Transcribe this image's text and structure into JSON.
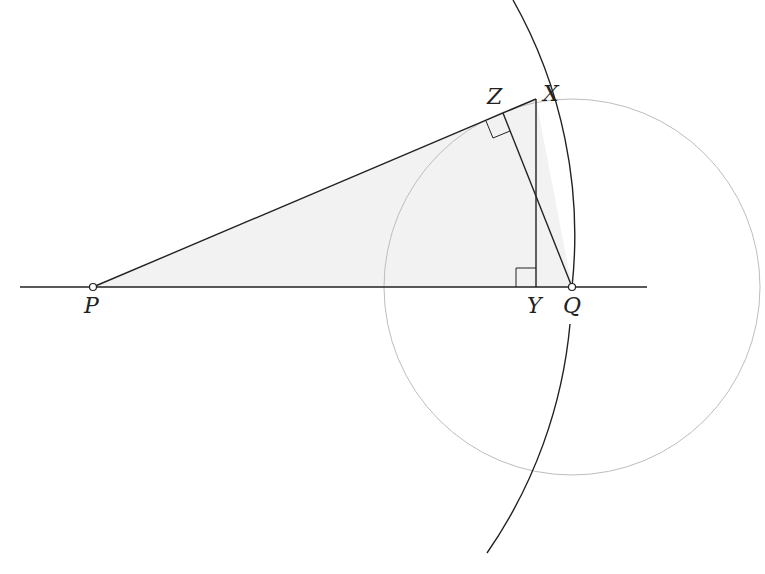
{
  "diagram": {
    "points": {
      "P": {
        "label": "P",
        "x": 93,
        "y": 287
      },
      "Q": {
        "label": "Q",
        "x": 572,
        "y": 287
      },
      "X": {
        "label": "X",
        "x": 536,
        "y": 99
      },
      "Y": {
        "label": "Y",
        "x": 536,
        "y": 287
      },
      "Z": {
        "label": "Z",
        "x": 503,
        "y": 113
      }
    },
    "labels": {
      "P": "P",
      "Q": "Q",
      "X": "X",
      "Y": "Y",
      "Z": "Z"
    },
    "circle": {
      "cx": 572,
      "cy": 287,
      "r": 188,
      "color": "#bbbbbb"
    },
    "arc": {
      "center": "P",
      "radius": 479
    },
    "fill_color": "#f2f2f2",
    "line_color": "#222222",
    "right_angles": [
      "Y",
      "Z"
    ]
  }
}
